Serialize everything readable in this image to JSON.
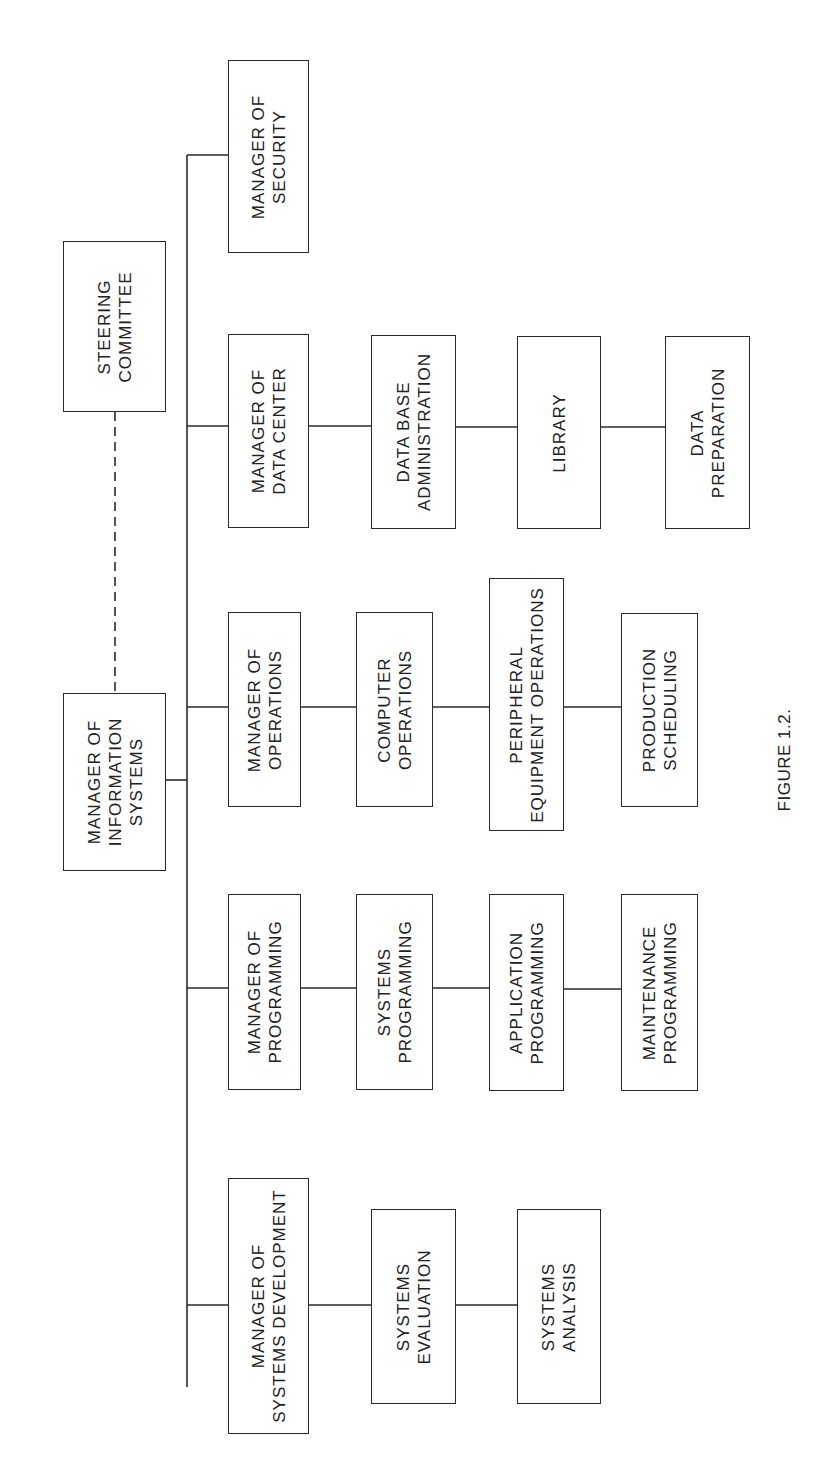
{
  "diagram": {
    "type": "organization_chart",
    "orientation": "rotated 90 degrees counter-clockwise",
    "line_color": "#2a2a2a",
    "caption": "FIGURE 1.2.",
    "root": {
      "id": "mis",
      "lines": [
        "MANAGER OF",
        "INFORMATION",
        "SYSTEMS"
      ]
    },
    "advisory": {
      "id": "steering",
      "lines": [
        "STEERING",
        "COMMITTEE"
      ],
      "connection": "dashed"
    },
    "departments": [
      {
        "id": "security",
        "manager": [
          "MANAGER OF",
          "SECURITY"
        ],
        "units": []
      },
      {
        "id": "datacenter",
        "manager": [
          "MANAGER OF",
          "DATA CENTER"
        ],
        "units": [
          [
            "DATA BASE",
            "ADMINISTRATION"
          ],
          [
            "LIBRARY"
          ],
          [
            "DATA",
            "PREPARATION"
          ]
        ]
      },
      {
        "id": "operations",
        "manager": [
          "MANAGER OF",
          "OPERATIONS"
        ],
        "units": [
          [
            "COMPUTER",
            "OPERATIONS"
          ],
          [
            "PERIPHERAL",
            "EQUIPMENT OPERATIONS"
          ],
          [
            "PRODUCTION",
            "SCHEDULING"
          ]
        ]
      },
      {
        "id": "programming",
        "manager": [
          "MANAGER OF",
          "PROGRAMMING"
        ],
        "units": [
          [
            "SYSTEMS",
            "PROGRAMMING"
          ],
          [
            "APPLICATION",
            "PROGRAMMING"
          ],
          [
            "MAINTENANCE",
            "PROGRAMMING"
          ]
        ]
      },
      {
        "id": "sysdev",
        "manager": [
          "MANAGER OF",
          "SYSTEMS DEVELOPMENT"
        ],
        "units": [
          [
            "SYSTEMS",
            "EVALUATION"
          ],
          [
            "SYSTEMS",
            "ANALYSIS"
          ]
        ]
      }
    ]
  }
}
